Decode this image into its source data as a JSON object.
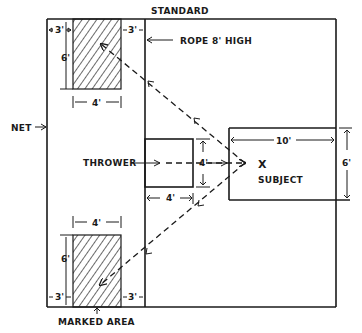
{
  "diagram": {
    "type": "field-layout",
    "labels": {
      "standard": "STANDARD",
      "rope": "ROPE  8' HIGH",
      "net": "NET",
      "thrower": "THROWER",
      "subject": "SUBJECT",
      "subject_mark": "X",
      "marked_area": "MARKED AREA"
    },
    "dimensions": {
      "top_left_gap": "3'",
      "top_right_gap": "3'",
      "top_height": "6'",
      "top_width": "4'",
      "bottom_width": "4'",
      "bottom_height": "6'",
      "bottom_left_gap": "3'",
      "bottom_right_gap": "3'",
      "thrower_height": "4'",
      "thrower_width": "4'",
      "subject_width": "10'",
      "subject_height": "6'"
    },
    "colors": {
      "ink": "#1a1a1a",
      "background": "#ffffff"
    }
  }
}
